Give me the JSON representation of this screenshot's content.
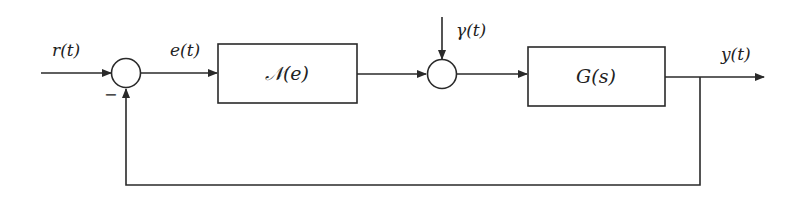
{
  "diagram": {
    "type": "feedback-control-block-diagram",
    "signals": {
      "input": "r(t)",
      "error": "e(t)",
      "disturbance": "γ(t)",
      "output": "y(t)"
    },
    "blocks": [
      {
        "id": "nonlinearity",
        "label": "𝒩(e)"
      },
      {
        "id": "plant",
        "label": "G(s)"
      }
    ],
    "summing_junctions": [
      {
        "id": "sum1",
        "feedback_sign": "−"
      },
      {
        "id": "sum2",
        "inputs": [
          "nonlinearity output",
          "γ(t)"
        ]
      }
    ],
    "colors": {
      "stroke": "#2a2a2a",
      "background": "#ffffff"
    }
  }
}
